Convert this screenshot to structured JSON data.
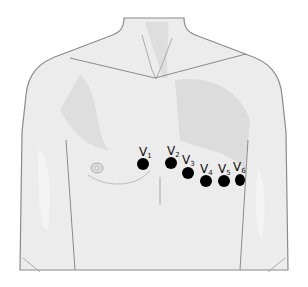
{
  "diagram": {
    "electrodes": [
      {
        "id": "V1",
        "letter": "V",
        "sub": "1",
        "x": 143,
        "y": 164,
        "lx": 139,
        "ly": 148
      },
      {
        "id": "V2",
        "letter": "V",
        "sub": "2",
        "x": 171,
        "y": 163,
        "lx": 167,
        "ly": 147
      },
      {
        "id": "V3",
        "letter": "V",
        "sub": "3",
        "x": 188,
        "y": 173,
        "lx": 182,
        "ly": 155
      },
      {
        "id": "V4",
        "letter": "V",
        "sub": "4",
        "x": 206,
        "y": 181,
        "lx": 201,
        "ly": 165
      },
      {
        "id": "V5",
        "letter": "V",
        "sub": "5",
        "x": 224,
        "y": 181,
        "lx": 219,
        "ly": 164
      },
      {
        "id": "V6",
        "letter": "V",
        "sub": "6",
        "x": 240,
        "y": 180,
        "lx": 234,
        "ly": 162
      }
    ],
    "colors": {
      "skin": "#ececec",
      "shade": "#dcdcdc",
      "outline": "#8a8a8a",
      "electrode": "#000000"
    }
  }
}
